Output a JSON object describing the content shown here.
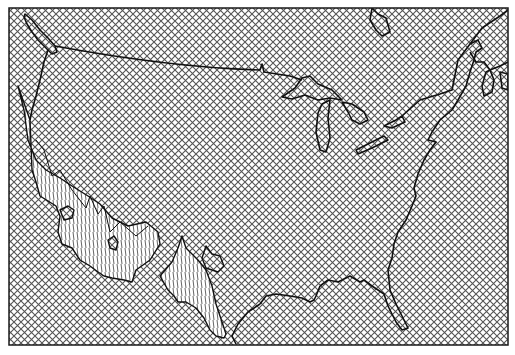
{
  "map": {
    "title": "",
    "width": 515,
    "height": 355,
    "frame": {
      "x": 9,
      "y": 8,
      "width": 499,
      "height": 337,
      "stroke": "#1a1a1a"
    },
    "colors": {
      "background": "#ffffff",
      "hatch": "#555555",
      "outline": "#111111",
      "surface_lines": "#222222"
    },
    "layers": [
      {
        "name": "base-crosshatch",
        "pattern": "diagonal-crosshatch"
      },
      {
        "name": "coastline-outline",
        "pattern": "stroke"
      },
      {
        "name": "relief-surface",
        "pattern": "vertical-line-hatch"
      }
    ],
    "features": [
      "international-border-us-canada",
      "great-lakes",
      "atlantic-coast",
      "gulf-coast",
      "florida-peninsula",
      "pacific-coast",
      "vancouver-island",
      "newfoundland",
      "nova-scotia",
      "hudson-bay-edge",
      "mexico-relief-surface",
      "central-america-relief-surface"
    ]
  }
}
